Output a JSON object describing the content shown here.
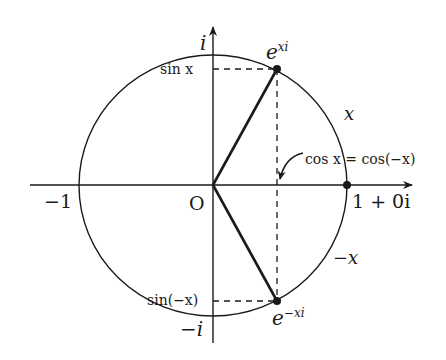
{
  "diagram": {
    "colors": {
      "stroke": "#1a1a1a",
      "background": "#ffffff"
    },
    "axes": {
      "real_axis_label_neg": "−1",
      "real_axis_label_pos": "1 + 0i",
      "origin_label": "O",
      "imag_axis_label_pos": "i",
      "imag_axis_label_neg": "−i"
    },
    "points": {
      "upper": {
        "label": "e",
        "sup": "xi"
      },
      "lower": {
        "label": "e",
        "sup": "−xi"
      },
      "unit": {
        "label": "1 + 0i"
      }
    },
    "projections": {
      "sin_pos": "sin x",
      "sin_neg": "sin(−x)",
      "cos_annotation": "cos x = cos(−x)"
    },
    "arcs": {
      "upper_angle": "x",
      "lower_angle": "−x"
    }
  }
}
